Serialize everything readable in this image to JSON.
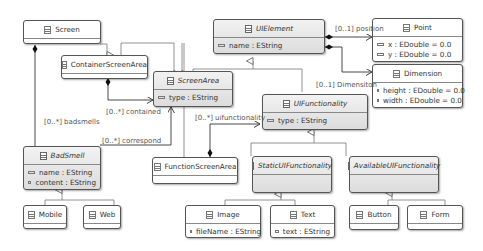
{
  "classes": {
    "screen": {
      "name": "Screen",
      "attrs": []
    },
    "container_screen_area": {
      "name": "ContainerScreenArea",
      "attrs": []
    },
    "ui_element": {
      "name": "UIElement",
      "abstract": true,
      "attrs": [
        "name : EString"
      ]
    },
    "screen_area": {
      "name": "ScreenArea",
      "abstract": true,
      "attrs": [
        "type : EString"
      ]
    },
    "point": {
      "name": "Point",
      "attrs": [
        "x : EDouble = 0.0",
        "y : EDouble = 0.0"
      ]
    },
    "dimension": {
      "name": "Dimension",
      "attrs": [
        "height : EDouble = 0.0",
        "width : EDouble = 0.0"
      ]
    },
    "ui_functionality": {
      "name": "UIFunctionality",
      "abstract": true,
      "attrs": [
        "type : EString"
      ]
    },
    "bad_smell": {
      "name": "BadSmell",
      "abstract": true,
      "attrs": [
        "name : EString",
        "content : EString"
      ]
    },
    "function_screen_area": {
      "name": "FunctionScreenArea",
      "attrs": []
    },
    "static_ui_functionality": {
      "name": "StaticUIFunctionality",
      "abstract": true,
      "attrs": []
    },
    "available_ui_functionality": {
      "name": "AvailableUIFunctionality",
      "abstract": true,
      "attrs": []
    },
    "mobile": {
      "name": "Mobile",
      "attrs": []
    },
    "web": {
      "name": "Web",
      "attrs": []
    },
    "image": {
      "name": "Image",
      "attrs": [
        "fileName : EString"
      ]
    },
    "text": {
      "name": "Text",
      "attrs": [
        "text : EString"
      ]
    },
    "button": {
      "name": "Button",
      "attrs": []
    },
    "form": {
      "name": "Form",
      "attrs": []
    }
  },
  "associations": {
    "position": "[0..1] position",
    "dimension": "[0..1] Dimensiton",
    "contained": "[0..*] contained",
    "badsmells": "[0..*] badsmells",
    "correspond": "[0..*] correspond",
    "uifunctionality": "[0..*] uifunctionality"
  }
}
